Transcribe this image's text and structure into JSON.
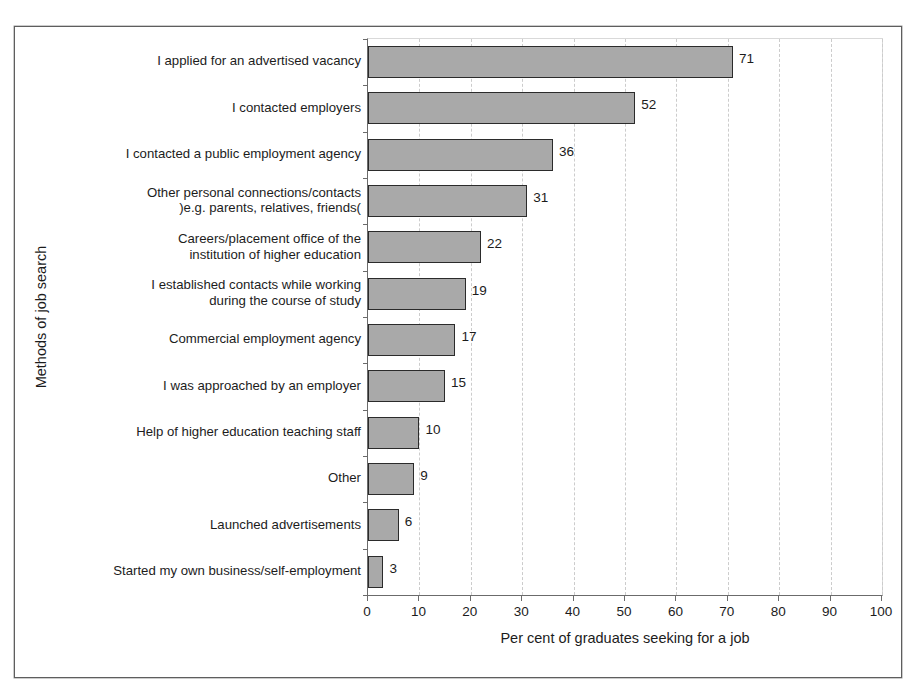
{
  "figure": {
    "title_remnant": "",
    "scan_smudge": ""
  },
  "chart_data": {
    "type": "bar",
    "orientation": "horizontal",
    "title": "",
    "xlabel": "Per cent of graduates seeking for a job",
    "ylabel": "Methods of job search",
    "xlim": [
      0,
      100
    ],
    "xtick_labels": [
      "0",
      "10",
      "20",
      "30",
      "40",
      "50",
      "60",
      "70",
      "80",
      "90",
      "100"
    ],
    "xtick_values": [
      0,
      10,
      20,
      30,
      40,
      50,
      60,
      70,
      80,
      90,
      100
    ],
    "grid": "vertical-dashed",
    "legend": "none",
    "bar_fill_color": "#a9a9a9",
    "bar_border_color": "#2b2b2b",
    "categories": [
      "I applied for an advertised vacancy",
      "I contacted employers",
      "I contacted a public employment agency",
      "Other personal connections/contacts\n)e.g. parents, relatives, friends(",
      "Careers/placement office of the\ninstitution of higher education",
      "I established contacts while working\nduring the course of study",
      "Commercial employment agency",
      "I was approached by an employer",
      "Help of higher education teaching staff",
      "Other",
      "Launched advertisements",
      "Started my own business/self-employment"
    ],
    "values": [
      71,
      52,
      36,
      31,
      22,
      19,
      17,
      15,
      10,
      9,
      6,
      3
    ],
    "data_labels": [
      "71",
      "52",
      "36",
      "31",
      "22",
      "19",
      "17",
      "15",
      "10",
      "9",
      "6",
      "3"
    ]
  }
}
